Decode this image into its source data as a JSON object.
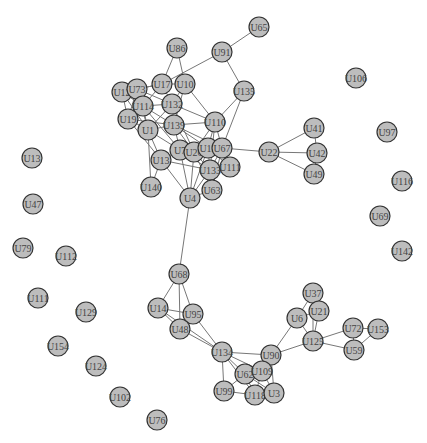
{
  "graph": {
    "type": "network",
    "node_radius": 10,
    "colors": {
      "node_fill": "#bdbdbd",
      "node_stroke": "#333333",
      "edge": "#777777",
      "label": "#444444"
    },
    "nodes": [
      {
        "id": "U65",
        "x": 259,
        "y": 27
      },
      {
        "id": "U86",
        "x": 177,
        "y": 48
      },
      {
        "id": "U91",
        "x": 222,
        "y": 52
      },
      {
        "id": "U17",
        "x": 162,
        "y": 84
      },
      {
        "id": "U10",
        "x": 185,
        "y": 84
      },
      {
        "id": "U12",
        "x": 122,
        "y": 92
      },
      {
        "id": "U73",
        "x": 137,
        "y": 89
      },
      {
        "id": "U114",
        "x": 143,
        "y": 106
      },
      {
        "id": "U132",
        "x": 172,
        "y": 104
      },
      {
        "id": "U135",
        "x": 244,
        "y": 91
      },
      {
        "id": "U19",
        "x": 128,
        "y": 119
      },
      {
        "id": "U1",
        "x": 148,
        "y": 130
      },
      {
        "id": "U139",
        "x": 174,
        "y": 125
      },
      {
        "id": "U110",
        "x": 215,
        "y": 122
      },
      {
        "id": "U7",
        "x": 180,
        "y": 150
      },
      {
        "id": "U26",
        "x": 194,
        "y": 152
      },
      {
        "id": "U12b",
        "label": "U12",
        "x": 208,
        "y": 148
      },
      {
        "id": "U67",
        "x": 222,
        "y": 148
      },
      {
        "id": "U22",
        "x": 269,
        "y": 152
      },
      {
        "id": "U41",
        "x": 314,
        "y": 128
      },
      {
        "id": "U42",
        "x": 317,
        "y": 153
      },
      {
        "id": "U49",
        "x": 314,
        "y": 174
      },
      {
        "id": "U13b",
        "label": "U13",
        "x": 161,
        "y": 160
      },
      {
        "id": "U133",
        "x": 210,
        "y": 170
      },
      {
        "id": "U111",
        "x": 230,
        "y": 167
      },
      {
        "id": "U140",
        "x": 151,
        "y": 187
      },
      {
        "id": "U63",
        "x": 212,
        "y": 190
      },
      {
        "id": "U4",
        "x": 190,
        "y": 198
      },
      {
        "id": "U106",
        "x": 356,
        "y": 78
      },
      {
        "id": "U97",
        "x": 387,
        "y": 132
      },
      {
        "id": "U116",
        "x": 402,
        "y": 181
      },
      {
        "id": "U69",
        "x": 380,
        "y": 216
      },
      {
        "id": "U142",
        "x": 402,
        "y": 251
      },
      {
        "id": "U13",
        "x": 32,
        "y": 158
      },
      {
        "id": "U47",
        "x": 33,
        "y": 204
      },
      {
        "id": "U79",
        "x": 23,
        "y": 248
      },
      {
        "id": "U112",
        "x": 66,
        "y": 256
      },
      {
        "id": "U111b",
        "label": "U111",
        "x": 38,
        "y": 298
      },
      {
        "id": "U129",
        "x": 86,
        "y": 312
      },
      {
        "id": "U154",
        "x": 58,
        "y": 346
      },
      {
        "id": "U124",
        "x": 96,
        "y": 366
      },
      {
        "id": "U102",
        "x": 120,
        "y": 397
      },
      {
        "id": "U76",
        "x": 157,
        "y": 420
      },
      {
        "id": "U68",
        "x": 179,
        "y": 274
      },
      {
        "id": "U14",
        "x": 158,
        "y": 308
      },
      {
        "id": "U95",
        "x": 193,
        "y": 314
      },
      {
        "id": "U48",
        "x": 180,
        "y": 329
      },
      {
        "id": "U134",
        "x": 222,
        "y": 352
      },
      {
        "id": "U90",
        "x": 271,
        "y": 355
      },
      {
        "id": "U62",
        "x": 245,
        "y": 374
      },
      {
        "id": "U109",
        "x": 262,
        "y": 371
      },
      {
        "id": "U99",
        "x": 224,
        "y": 391
      },
      {
        "id": "U118",
        "x": 255,
        "y": 395
      },
      {
        "id": "U3",
        "x": 274,
        "y": 393
      },
      {
        "id": "U37",
        "x": 313,
        "y": 293
      },
      {
        "id": "U6",
        "x": 297,
        "y": 318
      },
      {
        "id": "U21",
        "x": 319,
        "y": 311
      },
      {
        "id": "U125",
        "x": 313,
        "y": 341
      },
      {
        "id": "U72",
        "x": 353,
        "y": 328
      },
      {
        "id": "U153",
        "x": 378,
        "y": 329
      },
      {
        "id": "U59",
        "x": 354,
        "y": 350
      }
    ],
    "edges": [
      [
        "U65",
        "U91"
      ],
      [
        "U91",
        "U135"
      ],
      [
        "U91",
        "U17"
      ],
      [
        "U86",
        "U17"
      ],
      [
        "U86",
        "U10"
      ],
      [
        "U17",
        "U10"
      ],
      [
        "U17",
        "U73"
      ],
      [
        "U17",
        "U132"
      ],
      [
        "U17",
        "U114"
      ],
      [
        "U17",
        "U12"
      ],
      [
        "U10",
        "U132"
      ],
      [
        "U10",
        "U139"
      ],
      [
        "U10",
        "U110"
      ],
      [
        "U12",
        "U73"
      ],
      [
        "U12",
        "U114"
      ],
      [
        "U12",
        "U19"
      ],
      [
        "U12",
        "U1"
      ],
      [
        "U73",
        "U114"
      ],
      [
        "U73",
        "U19"
      ],
      [
        "U73",
        "U132"
      ],
      [
        "U73",
        "U1"
      ],
      [
        "U114",
        "U132"
      ],
      [
        "U114",
        "U19"
      ],
      [
        "U114",
        "U1"
      ],
      [
        "U114",
        "U139"
      ],
      [
        "U114",
        "U7"
      ],
      [
        "U132",
        "U139"
      ],
      [
        "U132",
        "U110"
      ],
      [
        "U132",
        "U1"
      ],
      [
        "U132",
        "U26"
      ],
      [
        "U19",
        "U1"
      ],
      [
        "U19",
        "U139"
      ],
      [
        "U19",
        "U13b"
      ],
      [
        "U1",
        "U139"
      ],
      [
        "U1",
        "U13b"
      ],
      [
        "U1",
        "U7"
      ],
      [
        "U1",
        "U140"
      ],
      [
        "U139",
        "U7"
      ],
      [
        "U139",
        "U26"
      ],
      [
        "U139",
        "U12b"
      ],
      [
        "U139",
        "U67"
      ],
      [
        "U139",
        "U110"
      ],
      [
        "U135",
        "U110"
      ],
      [
        "U135",
        "U67"
      ],
      [
        "U110",
        "U12b"
      ],
      [
        "U110",
        "U67"
      ],
      [
        "U110",
        "U26"
      ],
      [
        "U110",
        "U133"
      ],
      [
        "U7",
        "U26"
      ],
      [
        "U7",
        "U13b"
      ],
      [
        "U7",
        "U133"
      ],
      [
        "U7",
        "U4"
      ],
      [
        "U26",
        "U12b"
      ],
      [
        "U26",
        "U133"
      ],
      [
        "U26",
        "U63"
      ],
      [
        "U26",
        "U4"
      ],
      [
        "U12b",
        "U67"
      ],
      [
        "U12b",
        "U133"
      ],
      [
        "U12b",
        "U111"
      ],
      [
        "U12b",
        "U4"
      ],
      [
        "U67",
        "U22"
      ],
      [
        "U67",
        "U111"
      ],
      [
        "U67",
        "U133"
      ],
      [
        "U67",
        "U63"
      ],
      [
        "U22",
        "U41"
      ],
      [
        "U22",
        "U42"
      ],
      [
        "U22",
        "U49"
      ],
      [
        "U41",
        "U42"
      ],
      [
        "U42",
        "U49"
      ],
      [
        "U13b",
        "U140"
      ],
      [
        "U13b",
        "U4"
      ],
      [
        "U13b",
        "U133"
      ],
      [
        "U133",
        "U63"
      ],
      [
        "U133",
        "U4"
      ],
      [
        "U63",
        "U4"
      ],
      [
        "U4",
        "U68"
      ],
      [
        "U68",
        "U14"
      ],
      [
        "U68",
        "U95"
      ],
      [
        "U68",
        "U48"
      ],
      [
        "U14",
        "U95"
      ],
      [
        "U14",
        "U48"
      ],
      [
        "U14",
        "U134"
      ],
      [
        "U95",
        "U48"
      ],
      [
        "U95",
        "U134"
      ],
      [
        "U48",
        "U134"
      ],
      [
        "U134",
        "U90"
      ],
      [
        "U134",
        "U62"
      ],
      [
        "U134",
        "U109"
      ],
      [
        "U134",
        "U99"
      ],
      [
        "U134",
        "U118"
      ],
      [
        "U90",
        "U109"
      ],
      [
        "U90",
        "U3"
      ],
      [
        "U90",
        "U125"
      ],
      [
        "U90",
        "U6"
      ],
      [
        "U62",
        "U109"
      ],
      [
        "U62",
        "U99"
      ],
      [
        "U62",
        "U118"
      ],
      [
        "U62",
        "U3"
      ],
      [
        "U109",
        "U118"
      ],
      [
        "U109",
        "U3"
      ],
      [
        "U99",
        "U118"
      ],
      [
        "U118",
        "U3"
      ],
      [
        "U37",
        "U6"
      ],
      [
        "U37",
        "U21"
      ],
      [
        "U37",
        "U125"
      ],
      [
        "U6",
        "U21"
      ],
      [
        "U6",
        "U125"
      ],
      [
        "U21",
        "U125"
      ],
      [
        "U125",
        "U72"
      ],
      [
        "U125",
        "U59"
      ],
      [
        "U72",
        "U153"
      ],
      [
        "U72",
        "U59"
      ],
      [
        "U153",
        "U59"
      ]
    ]
  }
}
